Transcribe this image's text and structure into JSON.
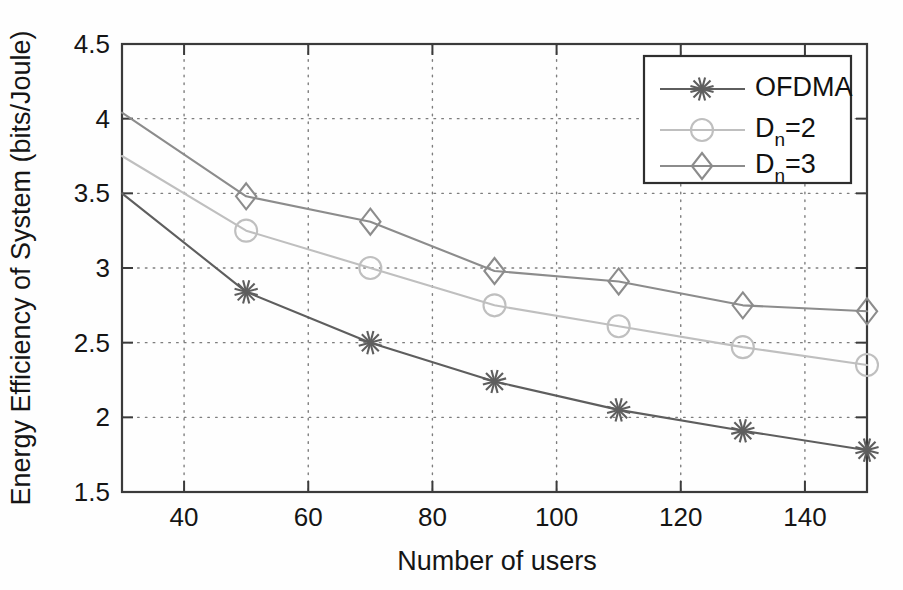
{
  "chart_data": {
    "type": "line",
    "title": "",
    "xlabel": "Number of users",
    "ylabel": "Energy Efficiency of System (bits/Joule)",
    "xlim": [
      30,
      150
    ],
    "ylim": [
      1.5,
      4.5
    ],
    "xticks": [
      40,
      60,
      80,
      100,
      120,
      140
    ],
    "yticks": [
      1.5,
      2,
      2.5,
      3,
      3.5,
      4,
      4.5
    ],
    "xtick_labels": [
      "40",
      "60",
      "80",
      "100",
      "120",
      "140"
    ],
    "ytick_labels": [
      "1.5",
      "2",
      "2.5",
      "3",
      "3.5",
      "4",
      "4.5"
    ],
    "grid": true,
    "grid_style": "dotted",
    "legend_position": "top-right",
    "x": [
      30,
      50,
      70,
      90,
      110,
      130,
      150
    ],
    "series": [
      {
        "name": "OFDMA",
        "legend_label": "OFDMA",
        "marker": "star",
        "color": "#5e5e5e",
        "values": [
          3.5,
          2.84,
          2.5,
          2.24,
          2.05,
          1.91,
          1.78
        ]
      },
      {
        "name": "Dn=2",
        "legend_label": "D",
        "legend_sub": "n",
        "legend_suffix": "=2",
        "marker": "circle",
        "color": "#bfbfbf",
        "values": [
          3.75,
          3.25,
          3.0,
          2.75,
          2.61,
          2.47,
          2.35
        ]
      },
      {
        "name": "Dn=3",
        "legend_label": "D",
        "legend_sub": "n",
        "legend_suffix": "=3",
        "marker": "diamond",
        "color": "#8c8c8c",
        "values": [
          4.04,
          3.48,
          3.31,
          2.98,
          2.91,
          2.75,
          2.71
        ]
      }
    ]
  },
  "axes": {
    "x_title": "Number of users",
    "y_title": "Energy Efficiency of System (bits/Joule)"
  },
  "legend": {
    "entries": [
      {
        "label": "OFDMA",
        "sub": "",
        "suffix": ""
      },
      {
        "label": "D",
        "sub": "n",
        "suffix": "=2"
      },
      {
        "label": "D",
        "sub": "n",
        "suffix": "=3"
      }
    ]
  },
  "colors": {
    "ofdma": "#5e5e5e",
    "dn2": "#bfbfbf",
    "dn3": "#8c8c8c",
    "axis": "#3b3b3b",
    "grid": "#7d7d7d",
    "background": "#fefefe"
  }
}
